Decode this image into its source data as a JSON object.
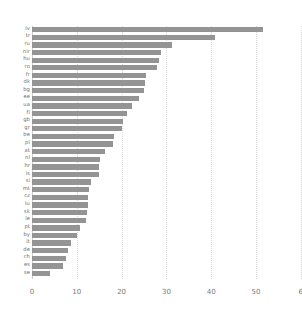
{
  "chart_data": {
    "type": "bar",
    "orientation": "horizontal",
    "title": "",
    "subtitle": "",
    "xlabel": "",
    "ylabel": "",
    "xlim": [
      0,
      60
    ],
    "ylim": null,
    "grid": true,
    "grid_axis": "x",
    "legend": false,
    "legend_position": "none",
    "bar_color": "#949494",
    "background_color": "#ffffff",
    "gridline_color": "#d8d8d8",
    "tick_label_color": "#7a7a7a",
    "xticks": [
      0,
      10,
      20,
      30,
      40,
      50,
      60
    ],
    "xtick_labels": [
      "0",
      "10",
      "20",
      "30",
      "40",
      "50",
      "6"
    ],
    "categories": [
      "lv",
      "tr",
      "ru",
      "nir",
      "hu",
      "ro",
      "fr",
      "dk",
      "bg",
      "ee",
      "ua",
      "fi",
      "gb",
      "gr",
      "be",
      "pl",
      "at",
      "nl",
      "hr",
      "is",
      "si",
      "mt",
      "cz",
      "lu",
      "sk",
      "ie",
      "pt",
      "by",
      "it",
      "de",
      "ch",
      "es",
      "se"
    ],
    "values": [
      51.5,
      40.8,
      31.2,
      28.8,
      28.4,
      27.8,
      25.5,
      25.3,
      25.0,
      23.8,
      22.4,
      21.2,
      20.4,
      20.2,
      18.2,
      18.0,
      16.2,
      15.1,
      15.0,
      14.9,
      13.2,
      12.7,
      12.6,
      12.4,
      12.2,
      12.0,
      10.8,
      10.1,
      8.8,
      8.1,
      7.6,
      7.0,
      4.0
    ],
    "points": [
      {
        "category": "lv",
        "value": 51.5
      },
      {
        "category": "tr",
        "value": 40.8
      },
      {
        "category": "ru",
        "value": 31.2
      },
      {
        "category": "nir",
        "value": 28.8
      },
      {
        "category": "hu",
        "value": 28.4
      },
      {
        "category": "ro",
        "value": 27.8
      },
      {
        "category": "fr",
        "value": 25.5
      },
      {
        "category": "dk",
        "value": 25.3
      },
      {
        "category": "bg",
        "value": 25.0
      },
      {
        "category": "ee",
        "value": 23.8
      },
      {
        "category": "ua",
        "value": 22.4
      },
      {
        "category": "fi",
        "value": 21.2
      },
      {
        "category": "gb",
        "value": 20.4
      },
      {
        "category": "gr",
        "value": 20.2
      },
      {
        "category": "be",
        "value": 18.2
      },
      {
        "category": "pl",
        "value": 18.0
      },
      {
        "category": "at",
        "value": 16.2
      },
      {
        "category": "nl",
        "value": 15.1
      },
      {
        "category": "hr",
        "value": 15.0
      },
      {
        "category": "is",
        "value": 14.9
      },
      {
        "category": "si",
        "value": 13.2
      },
      {
        "category": "mt",
        "value": 12.7
      },
      {
        "category": "cz",
        "value": 12.6
      },
      {
        "category": "lu",
        "value": 12.4
      },
      {
        "category": "sk",
        "value": 12.2
      },
      {
        "category": "ie",
        "value": 12.0
      },
      {
        "category": "pt",
        "value": 10.8
      },
      {
        "category": "by",
        "value": 10.1
      },
      {
        "category": "it",
        "value": 8.8
      },
      {
        "category": "de",
        "value": 8.1
      },
      {
        "category": "ch",
        "value": 7.6
      },
      {
        "category": "es",
        "value": 7.0
      },
      {
        "category": "se",
        "value": 4.0
      }
    ]
  },
  "geometry": {
    "x_origin_px": 32,
    "px_per_unit": 4.48,
    "plot_top_px": 26,
    "row_pitch_px": 7.62,
    "bar_height_px": 5.3,
    "plot_height_px": 253
  }
}
